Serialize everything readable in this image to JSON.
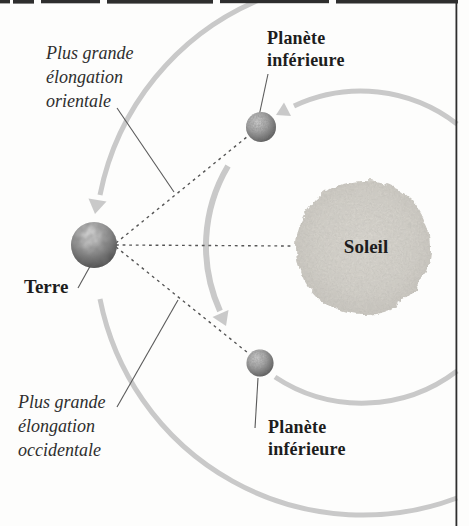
{
  "labels": {
    "elongation_east": {
      "lines": [
        "Plus grande",
        "élongation",
        "orientale"
      ]
    },
    "planet_top": {
      "lines": [
        "Planète",
        "inférieure"
      ]
    },
    "sun": "Soleil",
    "earth": "Terre",
    "elongation_west": {
      "lines": [
        "Plus grande",
        "élongation",
        "occidentale"
      ]
    },
    "planet_bottom": {
      "lines": [
        "Planète",
        "inférieure"
      ]
    }
  },
  "colors": {
    "background": "#fdfdfc",
    "orbit_arc": "#c9c9c9",
    "dashed_line": "#555555",
    "pointer_line": "#5a5a5a",
    "label_text": "#1d1d1d",
    "sun_fill": "#d6d3cc",
    "page_edge": "#2e2e2e"
  }
}
